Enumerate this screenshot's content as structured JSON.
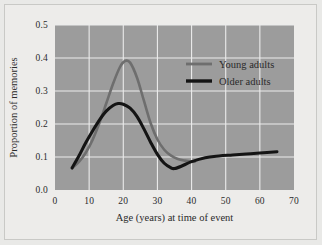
{
  "figure": {
    "background_color": "#edecea",
    "plot_background_color": "#9c9c9c",
    "grid_color": "#ebebeb",
    "text_color": "#2b2b2b"
  },
  "chart_data": {
    "type": "line",
    "title": "",
    "xlabel": "Age (years) at time of event",
    "ylabel": "Proportion of memories",
    "xlim": [
      0,
      70
    ],
    "ylim": [
      0.0,
      0.5
    ],
    "xticks": [
      0,
      10,
      20,
      30,
      40,
      50,
      60,
      70
    ],
    "xtick_labels": [
      "0",
      "10",
      "20",
      "30",
      "40",
      "50",
      "60",
      "70"
    ],
    "yticks": [
      0.0,
      0.1,
      0.2,
      0.3,
      0.4,
      0.5
    ],
    "ytick_labels": [
      "0.0",
      "0.1",
      "0.2",
      "0.3",
      "0.4",
      "0.5"
    ],
    "grid": true,
    "legend_position": "upper right",
    "series": [
      {
        "name": "Young adults",
        "color": "#6e6e6e",
        "x": [
          5,
          7,
          9,
          11,
          13,
          15,
          17,
          19,
          20.5,
          22,
          24,
          26,
          28,
          30,
          32,
          34,
          36,
          38,
          40,
          41
        ],
        "y": [
          0.066,
          0.085,
          0.113,
          0.152,
          0.203,
          0.262,
          0.322,
          0.372,
          0.391,
          0.386,
          0.341,
          0.272,
          0.203,
          0.153,
          0.122,
          0.104,
          0.094,
          0.089,
          0.086,
          0.086
        ]
      },
      {
        "name": "Older adults",
        "color": "#141414",
        "x": [
          5,
          7,
          9,
          11,
          13,
          15,
          17,
          18.5,
          20,
          22,
          24,
          26,
          28,
          30,
          32,
          34,
          35,
          37,
          40,
          44,
          48,
          52,
          56,
          60,
          65
        ],
        "y": [
          0.067,
          0.103,
          0.143,
          0.179,
          0.212,
          0.239,
          0.256,
          0.262,
          0.26,
          0.248,
          0.223,
          0.186,
          0.145,
          0.108,
          0.081,
          0.067,
          0.065,
          0.072,
          0.086,
          0.098,
          0.103,
          0.106,
          0.109,
          0.112,
          0.116
        ]
      }
    ],
    "legend": [
      {
        "label": "Young adults",
        "color": "#6e6e6e"
      },
      {
        "label": "Older adults",
        "color": "#141414"
      }
    ]
  }
}
